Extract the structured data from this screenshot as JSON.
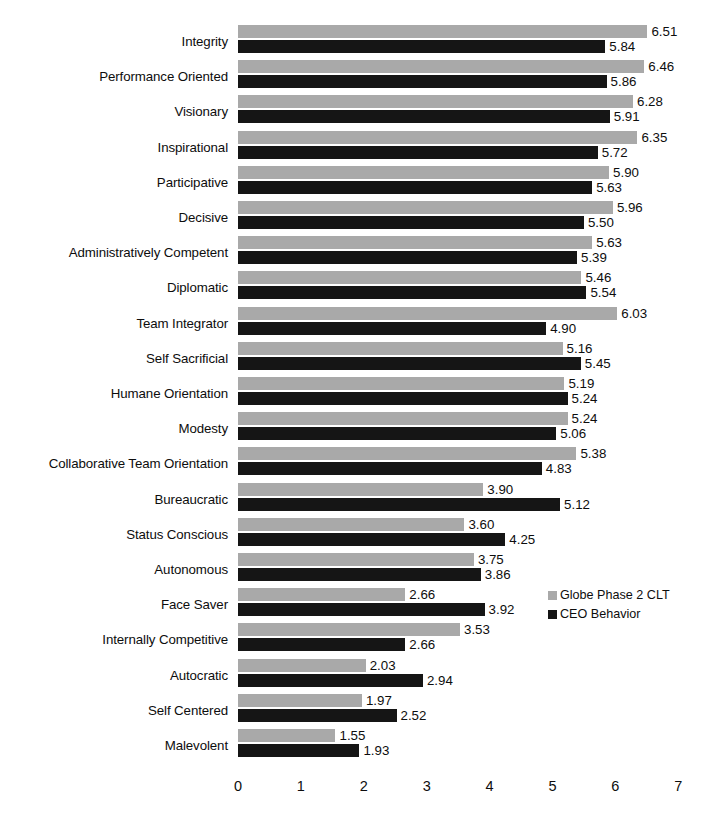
{
  "chart_data": {
    "type": "bar",
    "orientation": "horizontal",
    "title": "",
    "xlabel": "",
    "ylabel": "",
    "xlim": [
      0,
      7
    ],
    "xticks": [
      "0",
      "1",
      "2",
      "3",
      "4",
      "5",
      "6",
      "7"
    ],
    "grid": false,
    "legend_position": "right",
    "categories": [
      "Integrity",
      "Performance Oriented",
      "Visionary",
      "Inspirational",
      "Participative",
      "Decisive",
      "Administratively Competent",
      "Diplomatic",
      "Team Integrator",
      "Self Sacrificial",
      "Humane Orientation",
      "Modesty",
      "Collaborative Team Orientation",
      "Bureaucratic",
      "Status Conscious",
      "Autonomous",
      "Face Saver",
      "Internally Competitive",
      "Autocratic",
      "Self Centered",
      "Malevolent"
    ],
    "series": [
      {
        "name": "Globe Phase 2 CLT",
        "color": "#a9a9a9",
        "values": [
          6.51,
          6.46,
          6.28,
          6.35,
          5.9,
          5.96,
          5.63,
          5.46,
          6.03,
          5.16,
          5.19,
          5.24,
          5.38,
          3.9,
          3.6,
          3.75,
          2.66,
          3.53,
          2.03,
          1.97,
          1.55
        ],
        "labels": [
          "6.51",
          "6.46",
          "6.28",
          "6.35",
          "5.90",
          "5.96",
          "5.63",
          "5.46",
          "6.03",
          "5.16",
          "5.19",
          "5.24",
          "5.38",
          "3.90",
          "3.60",
          "3.75",
          "2.66",
          "3.53",
          "2.03",
          "1.97",
          "1.55"
        ]
      },
      {
        "name": "CEO Behavior",
        "color": "#151515",
        "values": [
          5.84,
          5.86,
          5.91,
          5.72,
          5.63,
          5.5,
          5.39,
          5.54,
          4.9,
          5.45,
          5.24,
          5.06,
          4.83,
          5.12,
          4.25,
          3.86,
          3.92,
          2.66,
          2.94,
          2.52,
          1.93
        ],
        "labels": [
          "5.84",
          "5.86",
          "5.91",
          "5.72",
          "5.63",
          "5.50",
          "5.39",
          "5.54",
          "4.90",
          "5.45",
          "5.24",
          "5.06",
          "4.83",
          "5.12",
          "4.25",
          "3.86",
          "3.92",
          "2.66",
          "2.94",
          "2.52",
          "1.93"
        ]
      }
    ]
  },
  "legend": {
    "items": [
      {
        "label": "Globe Phase 2 CLT",
        "color": "#a9a9a9"
      },
      {
        "label": "CEO Behavior",
        "color": "#151515"
      }
    ]
  }
}
